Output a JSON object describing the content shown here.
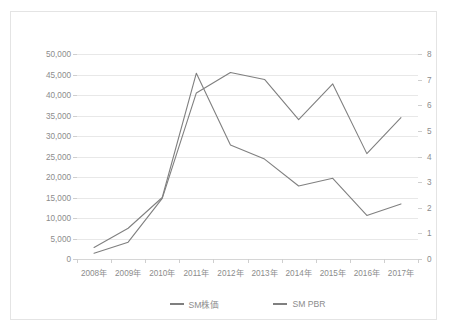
{
  "chart_data": {
    "type": "line",
    "title": "",
    "xlabel": "",
    "ylabel": "",
    "grid": true,
    "legend_position": "bottom",
    "categories": [
      "2008年",
      "2009年",
      "2010年",
      "2011年",
      "2012年",
      "2013年",
      "2014年",
      "2015年",
      "2016年",
      "2017年"
    ],
    "axes": {
      "left": {
        "label": "",
        "ylim": [
          0,
          50000
        ],
        "tick_step": 5000,
        "ticks": [
          0,
          5000,
          10000,
          15000,
          20000,
          25000,
          30000,
          35000,
          40000,
          45000,
          50000
        ],
        "tick_labels": [
          "0",
          "5,000",
          "10,000",
          "15,000",
          "20,000",
          "25,000",
          "30,000",
          "35,000",
          "40,000",
          "45,000",
          "50,000"
        ]
      },
      "right": {
        "label": "",
        "ylim": [
          0,
          8
        ],
        "tick_step": 1,
        "ticks": [
          0,
          1,
          2,
          3,
          4,
          5,
          6,
          7,
          8
        ],
        "tick_labels": [
          "0",
          "1",
          "2",
          "3",
          "4",
          "5",
          "6",
          "7",
          "8"
        ]
      }
    },
    "series": [
      {
        "name": "SM株価",
        "axis": "left",
        "color": "#7f7f7f",
        "values": [
          1400,
          4100,
          14800,
          40500,
          45500,
          43800,
          34000,
          42700,
          25700,
          34500
        ]
      },
      {
        "name": "SM PBR",
        "axis": "right",
        "color": "#808080",
        "values": [
          0.45,
          1.2,
          2.4,
          7.25,
          4.45,
          3.9,
          2.85,
          3.15,
          1.7,
          2.15
        ]
      }
    ]
  },
  "legend": {
    "entries": [
      {
        "label": "SM株価",
        "color": "#7f7f7f"
      },
      {
        "label": "SM PBR",
        "color": "#808080"
      }
    ]
  },
  "colors": {
    "frame_border": "#e4e4e4",
    "gridline": "#e8e8e8",
    "axis_line": "#d6d6d6",
    "tick_text": "#8c8c8c",
    "background": "#ffffff"
  }
}
